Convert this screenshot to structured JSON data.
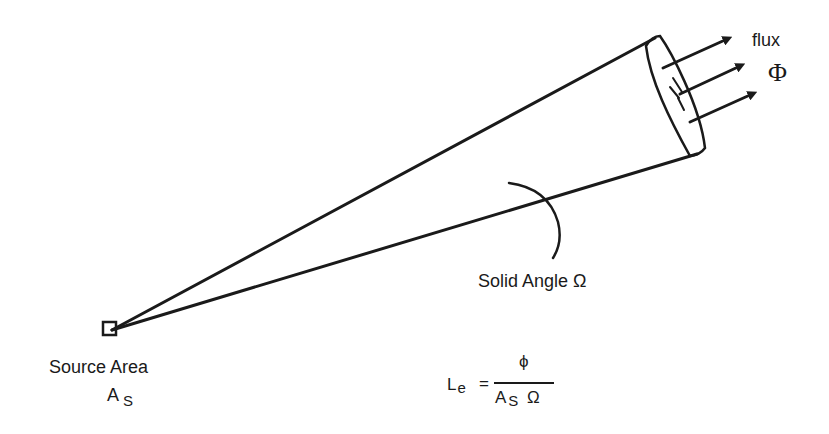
{
  "diagram": {
    "labels": {
      "flux": "flux",
      "flux_symbol": "Φ",
      "solid_angle": "Solid Angle Ω",
      "source_area": "Source Area",
      "source_symbol": "A",
      "source_subscript": "S"
    },
    "formula": {
      "lhs_symbol": "L",
      "lhs_subscript": "e",
      "equals": "=",
      "numerator": "ϕ",
      "denominator_symbol": "A",
      "denominator_subscript": "S",
      "denominator_angle": "Ω"
    },
    "elements": {
      "source": "small square source area",
      "cone": "cone of rays from source to far end cap",
      "end_cap": "elliptical cross-section at far end of cone",
      "arrows": 3,
      "arc": "solid angle indicator arc"
    },
    "stroke_color": "#1a1a1a",
    "background_color": "#ffffff"
  }
}
